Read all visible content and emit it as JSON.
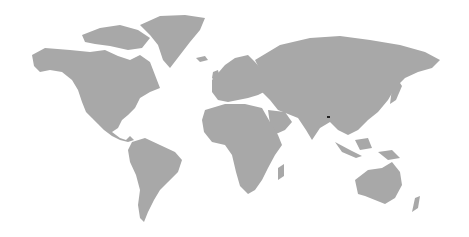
{
  "map": {
    "type": "world-map",
    "land_color": "#a8a8a8",
    "background_color": "#ffffff",
    "highlighted_region": {
      "name": "Bhutan",
      "color": "#222222",
      "position": [
        328,
        117
      ]
    }
  }
}
